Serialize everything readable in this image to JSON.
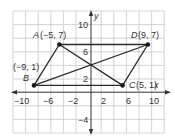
{
  "diagram": {
    "type": "coordinate-plane",
    "x_range": [
      -12,
      12
    ],
    "y_range": [
      -6,
      12
    ],
    "grid_step": 2,
    "axis_labels": {
      "x": "x",
      "y": "y"
    },
    "x_ticks": [
      {
        "value": -10,
        "label": "−10"
      },
      {
        "value": -6,
        "label": "−6"
      },
      {
        "value": -2,
        "label": "−2"
      },
      {
        "value": 2,
        "label": "2"
      },
      {
        "value": 6,
        "label": "6"
      },
      {
        "value": 10,
        "label": "10"
      }
    ],
    "y_ticks": [
      {
        "value": 10,
        "label": "10"
      },
      {
        "value": 6,
        "label": "6"
      },
      {
        "value": 2,
        "label": "2"
      },
      {
        "value": -4,
        "label": "−4"
      }
    ],
    "points": {
      "A": {
        "name": "A",
        "coords": "(−5, 7)",
        "x": -5,
        "y": 7
      },
      "B": {
        "name": "B",
        "coords": "(−9, 1)",
        "x": -9,
        "y": 1
      },
      "C": {
        "name": "C",
        "coords": "(5, 1)",
        "x": 5,
        "y": 1
      },
      "D": {
        "name": "D",
        "coords": "(9, 7)",
        "x": 9,
        "y": 7
      }
    },
    "segments": [
      "AB",
      "BC",
      "CD",
      "DA",
      "AC",
      "BD"
    ],
    "colors": {
      "grid": "#c8c8c8",
      "axis": "#333333",
      "line": "#2a2a2a",
      "point": "#1a1a1a"
    }
  }
}
